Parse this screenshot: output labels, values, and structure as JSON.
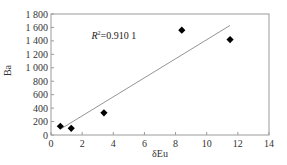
{
  "chart_data": {
    "type": "scatter",
    "title": "",
    "xlabel": "δEu",
    "ylabel": "Ba",
    "xlim": [
      0,
      14
    ],
    "ylim": [
      0,
      1800
    ],
    "x_ticks": [
      0,
      2,
      4,
      6,
      8,
      10,
      12,
      14
    ],
    "y_ticks": [
      0,
      200,
      400,
      600,
      800,
      1000,
      1200,
      1400,
      1600,
      1800
    ],
    "x_tick_labels": [
      "0",
      "2",
      "4",
      "6",
      "8",
      "10",
      "12",
      "14"
    ],
    "y_tick_labels": [
      "0",
      "200",
      "400",
      "600",
      "800",
      "1 000",
      "1 200",
      "1 400",
      "1 600",
      "1 800"
    ],
    "grid": false,
    "legend": null,
    "series": [
      {
        "name": "samples",
        "marker": "diamond",
        "color": "#000000",
        "points": [
          {
            "x": 0.6,
            "y": 130
          },
          {
            "x": 1.3,
            "y": 100
          },
          {
            "x": 3.4,
            "y": 330
          },
          {
            "x": 8.4,
            "y": 1560
          },
          {
            "x": 11.5,
            "y": 1420
          }
        ]
      }
    ],
    "trendline": {
      "type": "linear",
      "color": "#888888",
      "x_start": 0.7,
      "y_start": 100,
      "x_end": 11.5,
      "y_end": 1630
    },
    "annotations": [
      {
        "text": "R²=0.910 1",
        "x": 2.6,
        "y": 1480
      }
    ]
  },
  "labels": {
    "xlabel": "δEu",
    "ylabel": "Ba",
    "r2_prefix": "R",
    "r2_sup": "2",
    "r2_value": "=0.910 1"
  }
}
